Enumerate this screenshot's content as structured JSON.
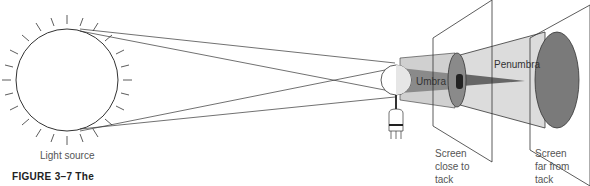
{
  "figure": {
    "caption": "FIGURE 3–7  The",
    "labels": {
      "light_source": "Light source",
      "umbra": "Umbra",
      "penumbra": "Penumbra",
      "screen_close": [
        "Screen",
        "close to",
        "tack"
      ],
      "screen_far": [
        "Screen",
        "far from",
        "tack"
      ]
    },
    "colors": {
      "line": "#333333",
      "penumbra_fill": "#d4d4d4",
      "umbra_fill": "#8a8a8a",
      "shadow_disc": "#7a7a7a",
      "core_dark": "#222222"
    }
  }
}
